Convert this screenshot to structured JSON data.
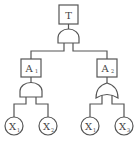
{
  "diagram": {
    "type": "fault-tree",
    "top_event": {
      "label": "T",
      "gate": "AND"
    },
    "intermediate_events": [
      {
        "label": "A",
        "subscript": "1",
        "gate": "AND",
        "children": [
          "X1",
          "X2"
        ]
      },
      {
        "label": "A",
        "subscript": "2",
        "gate": "OR",
        "children": [
          "X1",
          "X3"
        ]
      }
    ],
    "basic_events": [
      {
        "label": "X",
        "subscript": "1",
        "parent": "A1"
      },
      {
        "label": "X",
        "subscript": "2",
        "parent": "A1"
      },
      {
        "label": "X",
        "subscript": "1",
        "parent": "A2"
      },
      {
        "label": "X",
        "subscript": "3",
        "parent": "A2"
      }
    ],
    "colors": {
      "line": "#555555",
      "text": "#444444",
      "background": "#ffffff"
    }
  }
}
